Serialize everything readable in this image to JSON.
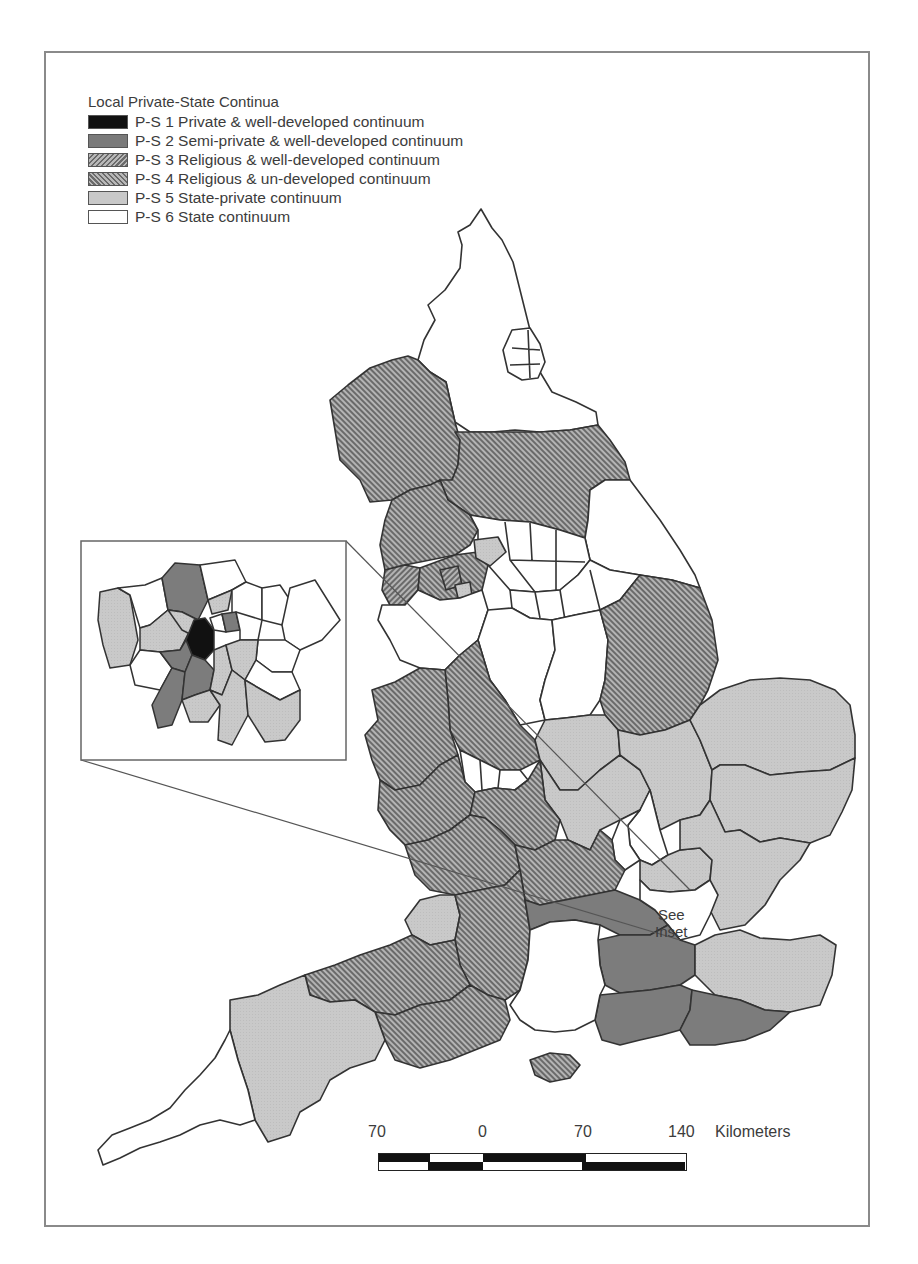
{
  "figure": {
    "type": "choropleth-map",
    "region": "England",
    "frame_border_color": "#8a8a8a"
  },
  "legend": {
    "title": "Local Private-State Continua",
    "items": [
      {
        "code": "P-S 1",
        "label": "P-S 1 Private & well-developed continuum",
        "fill": "solid-black",
        "color": "#111111"
      },
      {
        "code": "P-S 2",
        "label": "P-S 2 Semi-private & well-developed continuum",
        "fill": "solid-dark-grey",
        "color": "#7a7a7a"
      },
      {
        "code": "P-S 3",
        "label": "P-S 3 Religious & well-developed continuum",
        "fill": "forward-diagonal-hatch",
        "color": "#8c8c8c"
      },
      {
        "code": "P-S 4",
        "label": "P-S 4  Religious & un-developed continuum",
        "fill": "backward-diagonal-hatch",
        "color": "#8c8c8c"
      },
      {
        "code": "P-S 5",
        "label": "P-S 5 State-private continuum",
        "fill": "solid-light-grey",
        "color": "#c8c8c8"
      },
      {
        "code": "P-S 6",
        "label": "P-S 6 State continuum",
        "fill": "white",
        "color": "#ffffff"
      }
    ]
  },
  "inset": {
    "subject": "London boroughs",
    "label_line1": "See",
    "label_line2": "Inset"
  },
  "scale_bar": {
    "ticks": [
      "70",
      "0",
      "70",
      "140"
    ],
    "unit": "Kilometers"
  },
  "map_regions": [
    {
      "name": "Northumberland / Tyne & Wear / Durham",
      "class": "P-S 6"
    },
    {
      "name": "Cumbria",
      "class": "P-S 3"
    },
    {
      "name": "North Yorkshire",
      "class": "P-S 3"
    },
    {
      "name": "Lancashire",
      "class": "P-S 3"
    },
    {
      "name": "Greater Manchester / Merseyside districts",
      "class": "P-S 3 / P-S 4 mix"
    },
    {
      "name": "East Riding / Humberside",
      "class": "P-S 6"
    },
    {
      "name": "West & South Yorkshire districts",
      "class": "P-S 6"
    },
    {
      "name": "Nottinghamshire / Derbyshire",
      "class": "P-S 6"
    },
    {
      "name": "Lincolnshire",
      "class": "P-S 3"
    },
    {
      "name": "Cheshire",
      "class": "P-S 6"
    },
    {
      "name": "Staffordshire",
      "class": "P-S 3"
    },
    {
      "name": "Shropshire",
      "class": "P-S 3"
    },
    {
      "name": "West Midlands conurbation",
      "class": "P-S 6"
    },
    {
      "name": "Leicestershire / Northamptonshire",
      "class": "P-S 5"
    },
    {
      "name": "Norfolk",
      "class": "P-S 5"
    },
    {
      "name": "Suffolk",
      "class": "P-S 5"
    },
    {
      "name": "Cambridgeshire",
      "class": "P-S 5"
    },
    {
      "name": "Bedfordshire",
      "class": "P-S 6"
    },
    {
      "name": "Essex",
      "class": "P-S 5"
    },
    {
      "name": "Hertfordshire",
      "class": "P-S 5"
    },
    {
      "name": "Hereford & Worcester",
      "class": "P-S 3"
    },
    {
      "name": "Warwickshire",
      "class": "P-S 3"
    },
    {
      "name": "Oxfordshire / Buckinghamshire",
      "class": "P-S 3"
    },
    {
      "name": "Gloucestershire / Avon",
      "class": "P-S 5"
    },
    {
      "name": "Berkshire",
      "class": "P-S 2"
    },
    {
      "name": "Surrey",
      "class": "P-S 2"
    },
    {
      "name": "West Sussex",
      "class": "P-S 2"
    },
    {
      "name": "East Sussex",
      "class": "P-S 2"
    },
    {
      "name": "Kent",
      "class": "P-S 5"
    },
    {
      "name": "Hampshire",
      "class": "P-S 6"
    },
    {
      "name": "Isle of Wight",
      "class": "P-S 3"
    },
    {
      "name": "Wiltshire",
      "class": "P-S 3"
    },
    {
      "name": "Somerset",
      "class": "P-S 3"
    },
    {
      "name": "Dorset",
      "class": "P-S 3"
    },
    {
      "name": "Devon",
      "class": "P-S 5"
    },
    {
      "name": "Cornwall",
      "class": "P-S 6"
    },
    {
      "name": "Greater London",
      "class": "see inset"
    }
  ]
}
